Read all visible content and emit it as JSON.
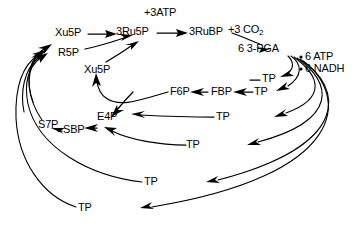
{
  "diagram": {
    "type": "pathway-diagram",
    "background_color": "#ffffff",
    "stroke_color": "#000000",
    "width": 359,
    "height": 225
  },
  "labels": {
    "plus_3_atp": "+3ATP",
    "xu5p_top": "Xu5P",
    "ru5p": "3Ru5P",
    "rubp": "3RuBP",
    "plus_3_co2_pre": "+3 CO",
    "plus_3_co2_sub": "2",
    "r5p": "R5P",
    "pga": "6 3-PGA",
    "xu5p_mid": "Xu5P",
    "atp_6": "6 ATP",
    "nadh_6": "6 NADH",
    "tp_r1": "TP",
    "tp_r2": "TP",
    "f6p": "F6P",
    "fbp": "FBP",
    "tp_mid": "TP",
    "e4p": "E4P",
    "s7p": "S7P",
    "sbp": "SBP",
    "tp_mid2": "TP",
    "tp_low": "TP",
    "tp_bottom": "TP",
    "bullet_glyph": "•"
  },
  "nodes": [
    {
      "id": "xu5p_top",
      "label": "Xu5P",
      "x": 55,
      "y": 28
    },
    {
      "id": "ru5p",
      "label": "3Ru5P",
      "x": 117,
      "y": 26
    },
    {
      "id": "rubp",
      "label": "3RuBP",
      "x": 189,
      "y": 26
    },
    {
      "id": "co2",
      "label": "+3 CO2",
      "x": 228,
      "y": 25
    },
    {
      "id": "atp_in",
      "label": "+3ATP",
      "x": 148,
      "y": 8
    },
    {
      "id": "r5p",
      "label": "R5P",
      "x": 58,
      "y": 48
    },
    {
      "id": "pga",
      "label": "6 3-PGA",
      "x": 238,
      "y": 43
    },
    {
      "id": "xu5p_mid",
      "label": "Xu5P",
      "x": 84,
      "y": 66
    },
    {
      "id": "atp6",
      "label": "6 ATP",
      "x": 307,
      "y": 56
    },
    {
      "id": "nadh6",
      "label": "6 NADH",
      "x": 307,
      "y": 68
    },
    {
      "id": "tp_r1",
      "label": "TP",
      "x": 263,
      "y": 73
    },
    {
      "id": "tp_r2",
      "label": "TP",
      "x": 255,
      "y": 86
    },
    {
      "id": "f6p",
      "label": "F6P",
      "x": 170,
      "y": 89
    },
    {
      "id": "fbp",
      "label": "FBP",
      "x": 212,
      "y": 86
    },
    {
      "id": "tp_mid",
      "label": "TP",
      "x": 218,
      "y": 113
    },
    {
      "id": "e4p",
      "label": "E4P",
      "x": 98,
      "y": 117
    },
    {
      "id": "s7p",
      "label": "S7P",
      "x": 39,
      "y": 120
    },
    {
      "id": "sbp",
      "label": "SBP",
      "x": 64,
      "y": 130
    },
    {
      "id": "tp_mid2",
      "label": "TP",
      "x": 188,
      "y": 141
    },
    {
      "id": "tp_low",
      "label": "TP",
      "x": 146,
      "y": 179
    },
    {
      "id": "tp_bottom",
      "label": "TP",
      "x": 80,
      "y": 205
    }
  ],
  "edges": [
    {
      "from": "xu5p_top",
      "to": "ru5p",
      "kind": "straight-arrow"
    },
    {
      "from": "ru5p",
      "to": "rubp",
      "kind": "straight-arrow",
      "annotation": "+3ATP"
    },
    {
      "from": "rubp",
      "to": "pga",
      "kind": "curved-arrow",
      "annotation": "+3 CO2"
    },
    {
      "from": "r5p",
      "to": "ru5p",
      "kind": "curved-arrow"
    },
    {
      "from": "xu5p_mid",
      "to": "ru5p",
      "kind": "curved-arrow"
    },
    {
      "from": "pga",
      "to": "tp_r1",
      "kind": "curved-arrow",
      "annotation": "6 ATP / 6 NADH"
    },
    {
      "from": "pga",
      "to": "tp_r2",
      "kind": "curved-arrow"
    },
    {
      "from": "tp_r2",
      "to": "fbp",
      "kind": "straight-arrow"
    },
    {
      "from": "fbp",
      "to": "f6p",
      "kind": "straight-arrow"
    },
    {
      "from": "f6p",
      "to": "xu5p_mid",
      "kind": "curved-arrow"
    },
    {
      "from": "tp_mid",
      "to": "e4p",
      "kind": "curved-arrow"
    },
    {
      "from": "e4p",
      "to": "sbp",
      "kind": "straight-arrow"
    },
    {
      "from": "sbp",
      "to": "s7p",
      "kind": "straight-arrow"
    },
    {
      "from": "tp_mid2",
      "to": "sbp",
      "kind": "curved-arrow"
    },
    {
      "from": "s7p",
      "to": "xu5p_top",
      "kind": "curved-arrow"
    },
    {
      "from": "tp_low",
      "to": "r5p",
      "kind": "curved-arrow"
    },
    {
      "from": "tp_bottom",
      "to": "r5p",
      "kind": "curved-arrow"
    }
  ]
}
